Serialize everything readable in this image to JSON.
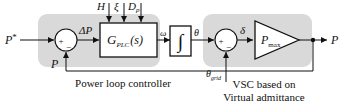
{
  "colors": {
    "region_fill": "#d9d9d9",
    "line": "#111111",
    "block_fill": "#ffffff"
  },
  "captions": {
    "power_loop": "Power loop controller",
    "vsc_line1": "VSC based on",
    "vsc_line2": "Virtual admittance"
  },
  "params": {
    "inertia": "H",
    "damping_ratio": "ξ",
    "damping_main": "D",
    "damping_sub": "p"
  },
  "blocks": {
    "plc_main": "G",
    "plc_sub": "PLC",
    "plc_arg": "(s)",
    "integrator": "∫",
    "gain_main": "P",
    "gain_sub": "max"
  },
  "signals": {
    "ref_main": "P",
    "ref_sup": "*",
    "error": "ΔP",
    "omega": "ω",
    "theta": "θ",
    "delta": "δ",
    "feedback": "P",
    "output": "P",
    "grid_main": "θ",
    "grid_sub": "grid"
  },
  "operators": {
    "plus": "+",
    "minus": "−"
  }
}
